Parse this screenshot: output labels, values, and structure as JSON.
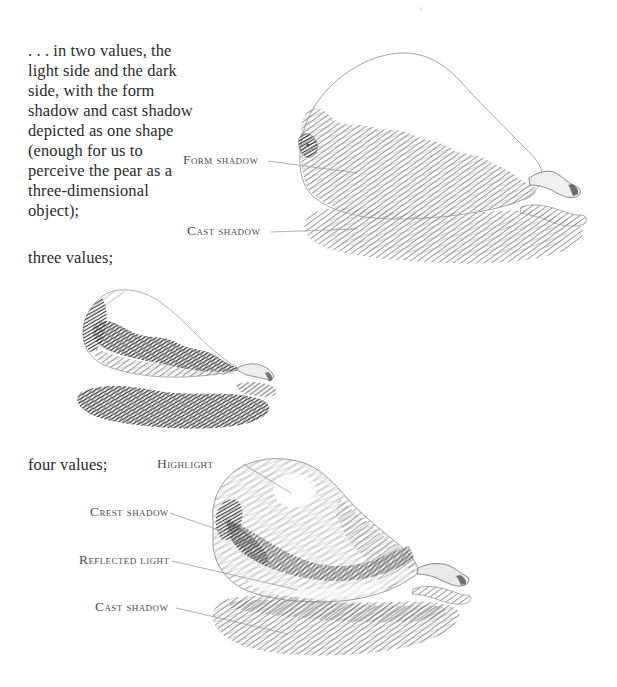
{
  "page": {
    "background": "#ffffff",
    "text_color": "#2b2b2b",
    "label_color": "#4d4d4d",
    "leader_line_color": "#9b9b9b",
    "pencil_light": "#adadad",
    "pencil_mid": "#909090",
    "pencil_dark": "#585858",
    "pencil_darkest": "#3c3c3c"
  },
  "intro_text": {
    "lines": [
      ". . . in two values, the",
      "light side and the dark",
      "side, with the form",
      "shadow and cast shadow",
      "depicted as one shape",
      "(enough for us to",
      "perceive the pear as a",
      "three-dimensional",
      "object);"
    ]
  },
  "captions": {
    "three_values": "three values;",
    "four_values": "four values;"
  },
  "figures": {
    "two_values": {
      "labels": {
        "form_shadow": "Form shadow",
        "cast_shadow": "Cast shadow"
      }
    },
    "three_values": {},
    "four_values": {
      "labels": {
        "highlight": "Highlight",
        "crest_shadow": "Crest shadow",
        "reflected_light": "Reflected light",
        "cast_shadow": "Cast shadow"
      }
    }
  }
}
